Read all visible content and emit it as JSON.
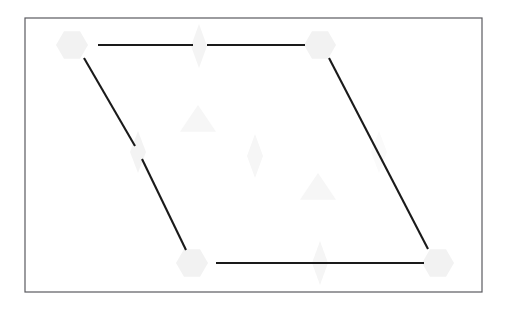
{
  "figure": {
    "title": "",
    "canvas": {
      "width": 510,
      "height": 309,
      "background": "#ffffff"
    },
    "frame": {
      "name": "plot-border",
      "x": 25,
      "y": 18,
      "width": 457,
      "height": 274,
      "stroke": "#5a5a5f",
      "stroke_width": 1.2,
      "fill": "#ffffff"
    },
    "colors": {
      "line": "#1a1a1a",
      "marker_light": "#f2f2f2",
      "marker_lighter": "#f6f6f6",
      "frame": "#5a5a5f",
      "background": "#ffffff"
    },
    "shape": {
      "type": "parallelogram",
      "vertices": [
        {
          "name": "top-left",
          "x": 72,
          "y": 45
        },
        {
          "name": "top-right",
          "x": 320,
          "y": 45
        },
        {
          "name": "bottom-right",
          "x": 438,
          "y": 263
        },
        {
          "name": "bottom-left",
          "x": 192,
          "y": 263
        }
      ]
    },
    "segments": [
      {
        "name": "top-edge-left",
        "x1": 98,
        "y1": 45,
        "x2": 193,
        "y2": 45
      },
      {
        "name": "top-edge-right",
        "x1": 207,
        "y1": 45,
        "x2": 305,
        "y2": 45
      },
      {
        "name": "left-edge-upper",
        "x1": 84,
        "y1": 58,
        "x2": 135,
        "y2": 146
      },
      {
        "name": "left-edge-lower",
        "x1": 142,
        "y1": 159,
        "x2": 186,
        "y2": 250
      },
      {
        "name": "right-edge",
        "x1": 329,
        "y1": 58,
        "x2": 428,
        "y2": 249
      },
      {
        "name": "bottom-edge",
        "x1": 216,
        "y1": 263,
        "x2": 424,
        "y2": 263
      }
    ],
    "markers": [
      {
        "name": "hexagon-top-left",
        "kind": "hexagon",
        "cx": 72,
        "cy": 45,
        "r": 16,
        "fill": "#f2f2f2"
      },
      {
        "name": "hexagon-top-right",
        "kind": "hexagon",
        "cx": 320,
        "cy": 45,
        "r": 16,
        "fill": "#f2f2f2"
      },
      {
        "name": "hexagon-bottom-left",
        "kind": "hexagon",
        "cx": 192,
        "cy": 263,
        "r": 16,
        "fill": "#f2f2f2"
      },
      {
        "name": "hexagon-bottom-right",
        "kind": "hexagon",
        "cx": 438,
        "cy": 263,
        "r": 16,
        "fill": "#f2f2f2"
      },
      {
        "name": "diamond-top-mid",
        "kind": "diamond",
        "cx": 199,
        "cy": 46,
        "rx": 8,
        "ry": 22,
        "fill": "#f4f4f4"
      },
      {
        "name": "diamond-center",
        "kind": "diamond",
        "cx": 255,
        "cy": 156,
        "rx": 8,
        "ry": 22,
        "fill": "#f6f6f6"
      },
      {
        "name": "diamond-left-mid",
        "kind": "diamond",
        "cx": 138,
        "cy": 152,
        "rx": 8,
        "ry": 21,
        "fill": "#f3f3f3"
      },
      {
        "name": "diamond-bottom-mid",
        "kind": "diamond",
        "cx": 320,
        "cy": 263,
        "rx": 8,
        "ry": 22,
        "fill": "#f5f5f5"
      },
      {
        "name": "diamond-right-mid",
        "kind": "diamond",
        "cx": 379,
        "cy": 152,
        "rx": 8,
        "ry": 21,
        "fill": "#fafafa"
      },
      {
        "name": "triangle-upper",
        "kind": "triangle",
        "cx": 198,
        "cy": 120,
        "r": 18,
        "fill": "#f6f6f6"
      },
      {
        "name": "triangle-lower",
        "kind": "triangle",
        "cx": 318,
        "cy": 188,
        "r": 18,
        "fill": "#f6f6f6"
      }
    ]
  },
  "chart_data": {
    "type": "scatter",
    "title": "",
    "subtitle": "",
    "xlabel": "",
    "ylabel": "",
    "xlim": [
      25,
      482
    ],
    "ylim": [
      18,
      292
    ],
    "grid": false,
    "legend": null,
    "tick_labels": {
      "x": [],
      "y": []
    },
    "annotations": [],
    "series": [
      {
        "name": "vertex-hexagons",
        "marker": "hexagon",
        "color": "#f2f2f2",
        "points": [
          {
            "x": 72,
            "y": 45
          },
          {
            "x": 320,
            "y": 45
          },
          {
            "x": 438,
            "y": 263
          },
          {
            "x": 192,
            "y": 263
          }
        ]
      },
      {
        "name": "midpoint-diamonds",
        "marker": "diamond",
        "color": "#f4f4f4",
        "points": [
          {
            "x": 199,
            "y": 46
          },
          {
            "x": 138,
            "y": 152
          },
          {
            "x": 255,
            "y": 156
          },
          {
            "x": 379,
            "y": 152
          },
          {
            "x": 320,
            "y": 263
          }
        ]
      },
      {
        "name": "interior-triangles",
        "marker": "triangle",
        "color": "#f6f6f6",
        "points": [
          {
            "x": 198,
            "y": 120
          },
          {
            "x": 318,
            "y": 188
          }
        ]
      }
    ],
    "edges": [
      {
        "from": "top-left",
        "to": "top-right"
      },
      {
        "from": "top-left",
        "to": "bottom-left"
      },
      {
        "from": "top-right",
        "to": "bottom-right"
      },
      {
        "from": "bottom-left",
        "to": "bottom-right"
      }
    ]
  }
}
